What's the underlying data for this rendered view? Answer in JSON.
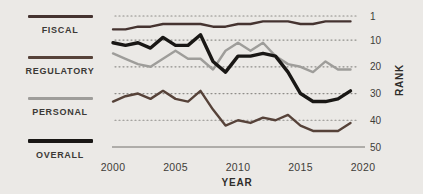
{
  "figure": {
    "background": "#ebe9e6"
  },
  "chart_data": {
    "type": "line",
    "title": "",
    "xlabel": "YEAR",
    "ylabel": "RANK",
    "x": [
      2000,
      2001,
      2002,
      2003,
      2004,
      2005,
      2006,
      2007,
      2008,
      2009,
      2010,
      2011,
      2012,
      2013,
      2014,
      2015,
      2016,
      2017,
      2018,
      2019
    ],
    "x_ticks": [
      2000,
      2005,
      2010,
      2015,
      2020
    ],
    "y_ticks": [
      1,
      10,
      20,
      30,
      40,
      50
    ],
    "y_axis": {
      "inverted": true,
      "min": 1,
      "max": 50,
      "side": "right"
    },
    "grid": "horizontal-dotted",
    "legend_position": "left",
    "series": [
      {
        "name": "FISCAL",
        "color": "#453330",
        "width": 2.4,
        "values": [
          6,
          6,
          5,
          5,
          4,
          4,
          4,
          4,
          5,
          5,
          4,
          4,
          3,
          3,
          3,
          4,
          4,
          3,
          3,
          3
        ]
      },
      {
        "name": "REGULATORY",
        "color": "#564239",
        "width": 2.4,
        "values": [
          33,
          31,
          30,
          32,
          29,
          32,
          33,
          29,
          36,
          42,
          40,
          41,
          39,
          40,
          38,
          42,
          44,
          44,
          44,
          41
        ]
      },
      {
        "name": "PERSONAL",
        "color": "#9e9d9a",
        "width": 2.4,
        "values": [
          15,
          17,
          19,
          20,
          17,
          14,
          17,
          17,
          21,
          14,
          11,
          14,
          11,
          16,
          19,
          20,
          22,
          18,
          21,
          21
        ]
      },
      {
        "name": "OVERALL",
        "color": "#191715",
        "width": 3.4,
        "values": [
          11,
          12,
          11,
          13,
          9,
          12,
          12,
          8,
          18,
          22,
          16,
          16,
          15,
          16,
          22,
          30,
          33,
          33,
          32,
          29
        ]
      }
    ]
  }
}
